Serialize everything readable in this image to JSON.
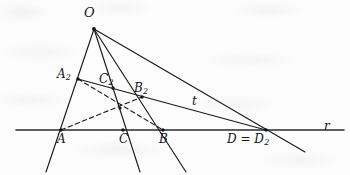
{
  "figure": {
    "background_color": "#fcfcfc",
    "ink_color": "#1a1a1e",
    "line_r_color": "#2b2b30"
  },
  "labels": {
    "apex": {
      "text": "O",
      "x": 94,
      "y": 29
    },
    "a2": {
      "base": "A",
      "sub": "2",
      "x": 78,
      "y": 79
    },
    "c2": {
      "base": "C",
      "sub": "2",
      "x": 113,
      "y": 88
    },
    "b2": {
      "base": "B",
      "sub": "2",
      "x": 142,
      "y": 97
    },
    "line_t": {
      "text": "t",
      "x": 196,
      "y": 101
    },
    "a": {
      "text": "A",
      "x": 61,
      "y": 130
    },
    "c": {
      "text": "C",
      "x": 123,
      "y": 130
    },
    "b": {
      "text": "B",
      "x": 163,
      "y": 130
    },
    "d": {
      "base": "D = D",
      "sub": "2",
      "x": 266,
      "y": 130
    },
    "line_r": {
      "text": "r",
      "x": 328,
      "y": 127
    }
  },
  "geometry": {
    "points": [
      {
        "name": "O",
        "x": 94,
        "y": 29,
        "dot": true
      },
      {
        "name": "A2",
        "x": 78,
        "y": 79,
        "dot": true
      },
      {
        "name": "C2",
        "x": 113,
        "y": 88,
        "dot": true
      },
      {
        "name": "B2",
        "x": 142,
        "y": 97,
        "dot": true
      },
      {
        "name": "X",
        "x": 120,
        "y": 108,
        "dot": true
      },
      {
        "name": "A",
        "x": 61,
        "y": 130,
        "dot": true
      },
      {
        "name": "C",
        "x": 123,
        "y": 130,
        "dot": true
      },
      {
        "name": "B",
        "x": 163,
        "y": 130,
        "dot": true
      },
      {
        "name": "D",
        "x": 266,
        "y": 130,
        "dot": true
      }
    ],
    "solid_segments": [
      {
        "name": "line-r",
        "x1": 16,
        "y1": 130,
        "x2": 344,
        "y2": 130,
        "width": 1.55
      },
      {
        "name": "ray-O-A",
        "x1": 94,
        "y1": 29,
        "x2": 46,
        "y2": 172,
        "width": 1.15
      },
      {
        "name": "ray-O-C",
        "x1": 94,
        "y1": 29,
        "x2": 140,
        "y2": 172,
        "width": 1.15
      },
      {
        "name": "ray-O-B",
        "x1": 94,
        "y1": 29,
        "x2": 186,
        "y2": 172,
        "width": 1.15
      },
      {
        "name": "ray-O-D",
        "x1": 94,
        "y1": 29,
        "x2": 305,
        "y2": 152,
        "width": 1.15
      },
      {
        "name": "line-t",
        "x1": 78,
        "y1": 79,
        "x2": 266,
        "y2": 130,
        "width": 1.15
      }
    ],
    "dashed_segments": [
      {
        "name": "dash-A2-to-B",
        "x1": 78,
        "y1": 79,
        "x2": 163,
        "y2": 130,
        "width": 1.1
      },
      {
        "name": "dash-A-to-B2",
        "x1": 61,
        "y1": 130,
        "x2": 142,
        "y2": 97,
        "width": 1.1
      }
    ]
  }
}
